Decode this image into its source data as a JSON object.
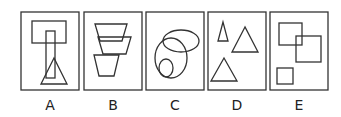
{
  "figure": {
    "type": "odd-one-out puzzle",
    "stroke_color": "#333333",
    "background": "#ffffff",
    "options": [
      {
        "label": "A",
        "shapes": [
          "rectangle",
          "tall rectangle",
          "triangle"
        ],
        "description": "wide rectangle on top, narrow vertical rectangle overlapping it, triangle overlapping narrow rectangle"
      },
      {
        "label": "B",
        "shapes": [
          "trapezoid",
          "trapezoid",
          "trapezoid"
        ],
        "description": "three inverted trapezoids stacked and overlapping"
      },
      {
        "label": "C",
        "shapes": [
          "ellipse",
          "ellipse",
          "ellipse"
        ],
        "description": "horizontal ellipse overlapping large ellipse containing a small ellipse"
      },
      {
        "label": "D",
        "shapes": [
          "triangle",
          "triangle",
          "triangle"
        ],
        "description": "three separate triangles, small, medium, medium"
      },
      {
        "label": "E",
        "shapes": [
          "square",
          "square",
          "square"
        ],
        "description": "two overlapping squares and one separate small square"
      }
    ]
  }
}
